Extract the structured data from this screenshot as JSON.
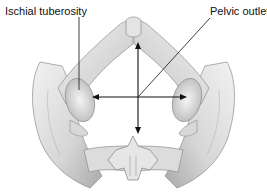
{
  "diagram": {
    "labels": {
      "ischial_tuberosity": "Ischial tuberosity",
      "pelvic_outlet": "Pelvic outlet"
    },
    "arrows": [
      {
        "name": "transverse-diameter-arrow",
        "orientation": "horizontal",
        "double_headed": true
      },
      {
        "name": "anteroposterior-diameter-arrow",
        "orientation": "vertical",
        "double_headed": true
      }
    ],
    "colors": {
      "bone_light": "#ececec",
      "bone_mid": "#cfcfcf",
      "bone_shadow": "#9a9a9a",
      "line": "#111111"
    }
  }
}
